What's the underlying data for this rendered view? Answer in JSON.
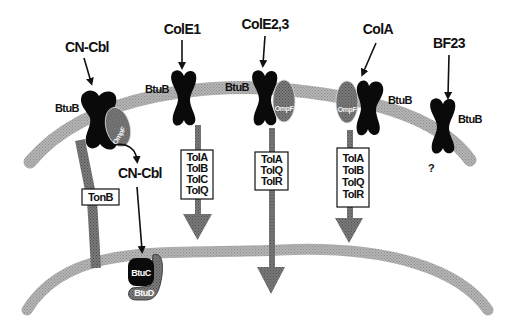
{
  "diagram": {
    "colors": {
      "membrane": "#a6a6a6",
      "receptor": "#0a0a0a",
      "ompf": "#6e6e6e",
      "tonb": "#6a6a6a",
      "translocation_arrow": "#8a8a8a",
      "box_border": "#111111",
      "text": "#111111"
    },
    "ligands": [
      {
        "id": "cn-cbl",
        "label": "CN-Cbl"
      },
      {
        "id": "cole1",
        "label": "ColE1"
      },
      {
        "id": "cole23",
        "label": "ColE2,3"
      },
      {
        "id": "cola",
        "label": "ColA"
      },
      {
        "id": "bf23",
        "label": "BF23"
      }
    ],
    "receptors": [
      {
        "label": "BtuB",
        "partner": "OmpF"
      },
      {
        "label": "BtuB"
      },
      {
        "label": "BtuB",
        "partner": "OmpF"
      },
      {
        "label": "BtuB",
        "partner": "OmpF"
      },
      {
        "label": "BtuB"
      }
    ],
    "ompf_label": "OmpF",
    "periplasm_ligand": "CN-Cbl",
    "tonb_label": "TonB",
    "inner_membrane_transporter": {
      "permease": "BtuC",
      "atpase": "BtuD"
    },
    "tol_boxes": [
      {
        "lines": [
          "TolA",
          "TolB",
          "TolC",
          "TolQ"
        ]
      },
      {
        "lines": [
          "TolA",
          "TolQ",
          "TolR"
        ]
      },
      {
        "lines": [
          "TolA",
          "TolB",
          "TolQ",
          "TolR"
        ]
      }
    ],
    "unknown_pathway": "?"
  }
}
